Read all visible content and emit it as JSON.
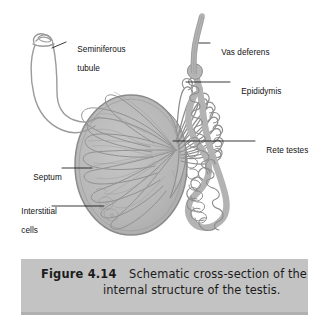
{
  "figure": {
    "domain_kind": "anatomical-diagram",
    "background_color": "#ffffff",
    "structure_fill_color": "#b9b9b9",
    "structure_outline_color": "#8a8a8a",
    "leader_line_color": "#1a1a1a",
    "label_text_color": "#111111"
  },
  "labels": [
    {
      "id": "seminiferous-tubule",
      "line1": "Seminiferous",
      "line2": "tubule"
    },
    {
      "id": "vas-deferens",
      "line1": "Vas deferens",
      "line2": ""
    },
    {
      "id": "epididymis",
      "line1": "Epididymis",
      "line2": ""
    },
    {
      "id": "rete-testes",
      "line1": "Rete testes",
      "line2": ""
    },
    {
      "id": "septum",
      "line1": "Septum",
      "line2": ""
    },
    {
      "id": "interstitial-cells",
      "line1": "Interstitial",
      "line2": "cells"
    }
  ],
  "caption": {
    "figure_number": "Figure 4.14",
    "line1": "Schematic cross-section of the",
    "line2": "internal structure of the testis.",
    "background_color": "#c3c3c3",
    "text_color": "#1b1b1b"
  },
  "anatomy_parts": [
    "testis-oval",
    "seminiferous-tubule-loop",
    "lobule-segments",
    "septum-partitions",
    "rete-testes",
    "efferent-ductules",
    "epididymis-coil",
    "vas-deferens"
  ]
}
